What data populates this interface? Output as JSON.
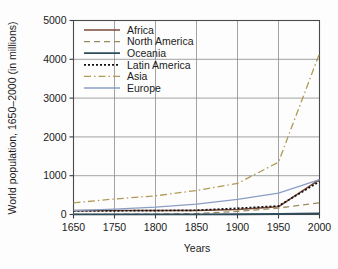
{
  "chart_data": {
    "type": "line",
    "title": "",
    "xlabel": "Years",
    "ylabel": "World population, 1650–2000 (in millions)",
    "x": [
      1650,
      1750,
      1800,
      1850,
      1900,
      1950,
      2000
    ],
    "xticklabels": [
      "1650",
      "1750",
      "1800",
      "1850",
      "1900",
      "1950",
      "2000"
    ],
    "xaxis_spacing": "categorical",
    "yticklabels": [
      "0",
      "1000",
      "2000",
      "3000",
      "4000",
      "5000"
    ],
    "yticks": [
      0,
      1000,
      2000,
      3000,
      4000,
      5000
    ],
    "ylim": [
      0,
      5000
    ],
    "grid": "both",
    "legend_position": "upper-left-inside",
    "series": [
      {
        "name": "Africa",
        "color": "#7a4a38",
        "dash": "none",
        "width": 1.6,
        "values": [
          100,
          105,
          105,
          105,
          130,
          200,
          900
        ]
      },
      {
        "name": "North America",
        "color": "#9c8a5e",
        "dash": "6,4",
        "width": 1.3,
        "values": [
          5,
          5,
          10,
          25,
          80,
          165,
          300
        ]
      },
      {
        "name": "Oceania",
        "color": "#2e4c5c",
        "dash": "none",
        "width": 1.8,
        "values": [
          2,
          2,
          2,
          2,
          6,
          13,
          30
        ]
      },
      {
        "name": "Latin America",
        "color": "#111111",
        "dash": "2,2",
        "width": 1.7,
        "values": [
          90,
          95,
          100,
          110,
          160,
          220,
          850
        ]
      },
      {
        "name": "Asia",
        "color": "#b09a55",
        "dash": "7,3,1.5,3",
        "width": 1.3,
        "values": [
          300,
          400,
          480,
          620,
          800,
          1350,
          4150
        ]
      },
      {
        "name": "Europe",
        "color": "#8a9ec4",
        "dash": "none",
        "width": 1.3,
        "values": [
          100,
          140,
          190,
          265,
          390,
          550,
          900
        ]
      }
    ]
  },
  "legend": {
    "entries": [
      {
        "label": "Africa"
      },
      {
        "label": "North America"
      },
      {
        "label": "Oceania"
      },
      {
        "label": "Latin America"
      },
      {
        "label": "Asia"
      },
      {
        "label": "Europe"
      }
    ]
  },
  "axes": {
    "x_title": "Years",
    "y_title": "World population, 1650–2000 (in millions)"
  }
}
